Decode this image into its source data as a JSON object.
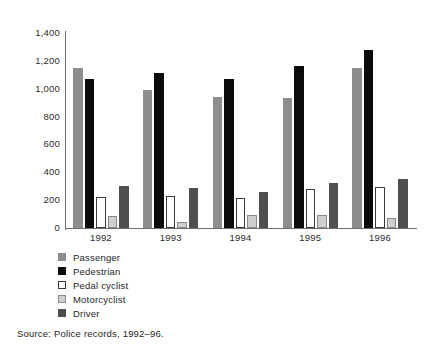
{
  "chart_data": {
    "type": "bar",
    "title": "",
    "xlabel": "",
    "ylabel": "",
    "categories": [
      "1992",
      "1993",
      "1994",
      "1995",
      "1996"
    ],
    "series": [
      {
        "name": "Passenger",
        "color": "#8d8d8d",
        "values": [
          1150,
          990,
          940,
          935,
          1150
        ]
      },
      {
        "name": "Pedestrian",
        "color": "#0b0b0b",
        "values": [
          1070,
          1110,
          1070,
          1165,
          1280
        ]
      },
      {
        "name": "Pedal cyclist",
        "color": "#ffffff",
        "values": [
          220,
          230,
          215,
          280,
          295
        ]
      },
      {
        "name": "Motorcyclist",
        "color": "#cfcfcf",
        "values": [
          85,
          40,
          90,
          95,
          75
        ]
      },
      {
        "name": "Driver",
        "color": "#4f4f4f",
        "values": [
          300,
          285,
          260,
          325,
          355
        ]
      }
    ],
    "ylim": [
      0,
      1400
    ],
    "yticks": [
      0,
      200,
      400,
      600,
      800,
      1000,
      1200,
      1400
    ],
    "ytick_labels": [
      "0",
      "200",
      "400",
      "600",
      "800",
      "1,000",
      "1,200",
      "1,400"
    ],
    "grid": false,
    "legend_position": "below-left"
  },
  "legend": {
    "items": [
      {
        "label": "Passenger",
        "swatch": "swatch-passenger"
      },
      {
        "label": "Pedestrian",
        "swatch": "swatch-pedestrian"
      },
      {
        "label": "Pedal cyclist",
        "swatch": "swatch-pedal-cyclist"
      },
      {
        "label": "Motorcyclist",
        "swatch": "swatch-motorcyclist"
      },
      {
        "label": "Driver",
        "swatch": "swatch-driver"
      }
    ]
  },
  "source": {
    "text": "Source: Police records, 1992–96."
  }
}
